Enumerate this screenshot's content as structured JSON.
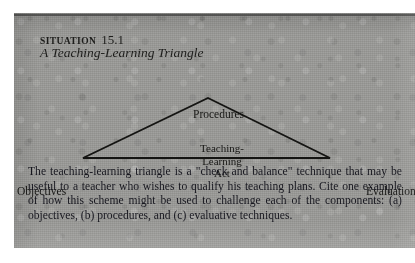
{
  "page": {
    "background_color": "#9b9b98",
    "ink_color": "#17171f"
  },
  "heading": {
    "situation_label": "SITUATION",
    "situation_number": "15.1",
    "subtitle": "A Teaching-Learning Triangle"
  },
  "diagram": {
    "type": "triangle",
    "apex_label": "Procedures",
    "bottom_left_label": "Objectives",
    "bottom_right_label": "Evaluation",
    "inner_lines": [
      "Teaching-",
      "Learning",
      "Act"
    ],
    "inner_text": "Teaching-Learning Act",
    "line_color": "#141412"
  },
  "body": {
    "paragraph": "The teaching-learning triangle is a \"check and balance\" technique that may be useful to a teacher who wishes to qualify his teaching plans. Cite one example of how this scheme might be used to challenge each of the components: (a) objectives, (b) procedures, and (c) evaluative techniques."
  }
}
